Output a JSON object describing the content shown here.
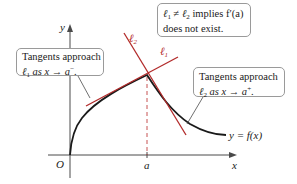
{
  "figure": {
    "axes": {
      "x_label": "x",
      "y_label": "y",
      "origin_label": "O",
      "a_label": "a"
    },
    "curve_label": "y = f(x)",
    "lines": {
      "l1": {
        "label": "ℓ1",
        "color": "#b22a2a"
      },
      "l2": {
        "label": "ℓ2",
        "color": "#b22a2a"
      }
    },
    "callouts": {
      "left": {
        "line1": "Tangents approach",
        "line2_prefix": "ℓ",
        "line2_sub": "1",
        "line2_mid": " as x → a",
        "line2_sup": "−",
        "line2_end": "."
      },
      "top_right": {
        "line1_a": "ℓ",
        "line1_a_sub": "1",
        "line1_neq": " ≠ ",
        "line1_b": "ℓ",
        "line1_b_sub": "2",
        "line1_rest": " implies f′(a)",
        "line2": "does not exist."
      },
      "right": {
        "line1": "Tangents approach",
        "line2_prefix": "ℓ",
        "line2_sub": "2",
        "line2_mid": " as x → a",
        "line2_sup": "+",
        "line2_end": "."
      }
    },
    "colors": {
      "tangent": "#b22a2a",
      "curve": "#1a1a1a",
      "axis": "#4a4a4a",
      "dashed": "#c04040"
    }
  }
}
